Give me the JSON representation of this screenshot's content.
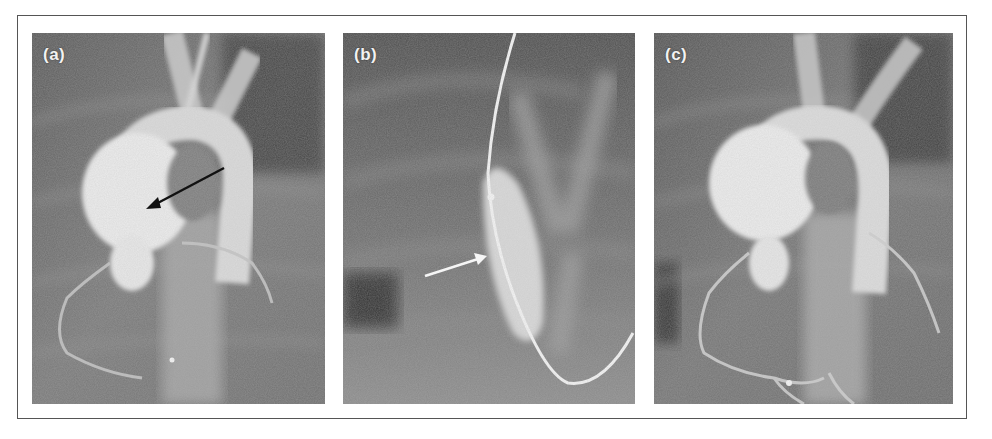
{
  "figure": {
    "panels": [
      {
        "id": "a",
        "label": "(a)",
        "description": "Aortic root angiogram showing aneurysmal sinus with coronary arteries",
        "arrow": {
          "color": "#111111",
          "direction": "down-left"
        }
      },
      {
        "id": "b",
        "label": "(b)",
        "description": "Ventriculogram with catheter in place",
        "arrow": {
          "color": "#f5f5f5",
          "direction": "up-right"
        }
      },
      {
        "id": "c",
        "label": "(c)",
        "description": "Aortic root angiogram with coronary arteries opacified",
        "arrow": null
      }
    ],
    "colors": {
      "frame_border": "#555555",
      "background": "#ffffff",
      "label_text": "#f2f2f2"
    }
  }
}
